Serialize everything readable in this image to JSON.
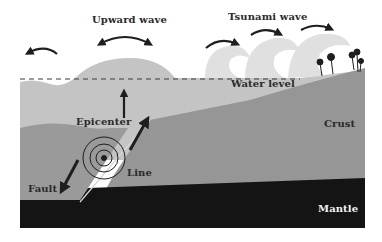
{
  "diagram": {
    "labels": {
      "upward_wave": "Upward wave",
      "tsunami_wave": "Tsunami wave",
      "water_level": "Water level",
      "epicenter": "Epicenter",
      "crust": "Crust",
      "line": "Line",
      "fault": "Fault",
      "mantle": "Mantle"
    },
    "colors": {
      "background": "#ffffff",
      "water": "#c4c4c4",
      "wave_foam": "#e2e2e2",
      "crust": "#9a9a9a",
      "crust_dark": "#8c8c8c",
      "mantle": "#141414",
      "arrow": "#1e1e1e"
    },
    "icons": [
      "curved-arrow-icon",
      "up-arrow-icon",
      "diagonal-arrow-icon",
      "seismic-rings-icon",
      "palm-tree-icon"
    ]
  }
}
